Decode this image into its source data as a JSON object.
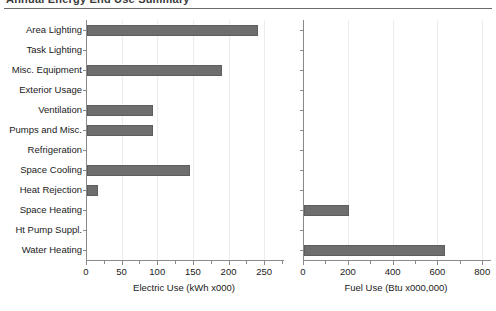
{
  "header": {
    "clipped_title": "Annual Energy End Use Summary",
    "rule_color": "#6b6b6b"
  },
  "style": {
    "bar_fill": "#6e6e6e",
    "bar_stroke": "#5e5e5e",
    "axis_color": "#8a8a8a",
    "grid_color": "#ececec",
    "text_color": "#1a1a1a",
    "background": "#ffffff"
  },
  "chart_data": [
    {
      "type": "bar",
      "orientation": "horizontal",
      "panel": "left",
      "title": "",
      "xlabel": "Electric Use (kWh x000)",
      "ylabel": "",
      "xlim": [
        0,
        275
      ],
      "xticks": [
        0,
        50,
        100,
        150,
        200,
        250
      ],
      "xtick_labels": [
        "0",
        "50",
        "100",
        "150",
        "200",
        "250"
      ],
      "minor_tick_interval": 25,
      "grid": true,
      "legend": "none",
      "categories": [
        "Area Lighting",
        "Task Lighting",
        "Misc. Equipment",
        "Exterior Usage",
        "Ventilation",
        "Pumps and Misc.",
        "Refrigeration",
        "Space Cooling",
        "Heat Rejection",
        "Space Heating",
        "Ht Pump Suppl.",
        "Water Heating"
      ],
      "values": [
        240,
        0,
        190,
        0,
        92,
        92,
        0,
        145,
        15,
        0,
        0,
        0
      ]
    },
    {
      "type": "bar",
      "orientation": "horizontal",
      "panel": "right",
      "title": "",
      "xlabel": "Fuel Use (Btu x000,000)",
      "ylabel": "",
      "xlim": [
        0,
        830
      ],
      "xticks": [
        0,
        200,
        400,
        600,
        800
      ],
      "xtick_labels": [
        "0",
        "200",
        "400",
        "600",
        "800"
      ],
      "minor_tick_interval": 100,
      "grid": true,
      "legend": "none",
      "categories": [
        "Area Lighting",
        "Task Lighting",
        "Misc. Equipment",
        "Exterior Usage",
        "Ventilation",
        "Pumps and Misc.",
        "Refrigeration",
        "Space Cooling",
        "Heat Rejection",
        "Space Heating",
        "Ht Pump Suppl.",
        "Water Heating"
      ],
      "values": [
        0,
        0,
        0,
        0,
        0,
        0,
        0,
        0,
        0,
        200,
        0,
        630
      ]
    }
  ]
}
